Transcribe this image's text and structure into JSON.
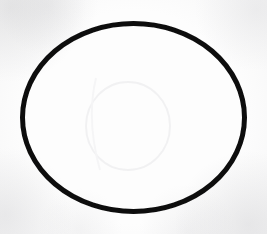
{
  "image": {
    "kind": "scanned-drawing",
    "width": 267,
    "height": 234,
    "background_color": "#fdfdfd",
    "paper_tint": "#f4f4f6",
    "subject": "hand-drawn ellipse outline"
  },
  "shape": {
    "name": "ellipse-outline",
    "stroke_color": "#111111",
    "fill_color": "none",
    "stroke_width_px": 5,
    "center_x": 133,
    "center_y": 117,
    "radius_x": 111,
    "radius_y": 94,
    "bounds": {
      "left": 20,
      "top": 21,
      "right": 247,
      "bottom": 214
    }
  },
  "ghost_mark": {
    "name": "faint-arc-impression",
    "stroke_color": "#e6e6e9",
    "stroke_width_px": 2,
    "center_x": 128,
    "center_y": 126,
    "radius_x": 42,
    "radius_y": 44
  }
}
